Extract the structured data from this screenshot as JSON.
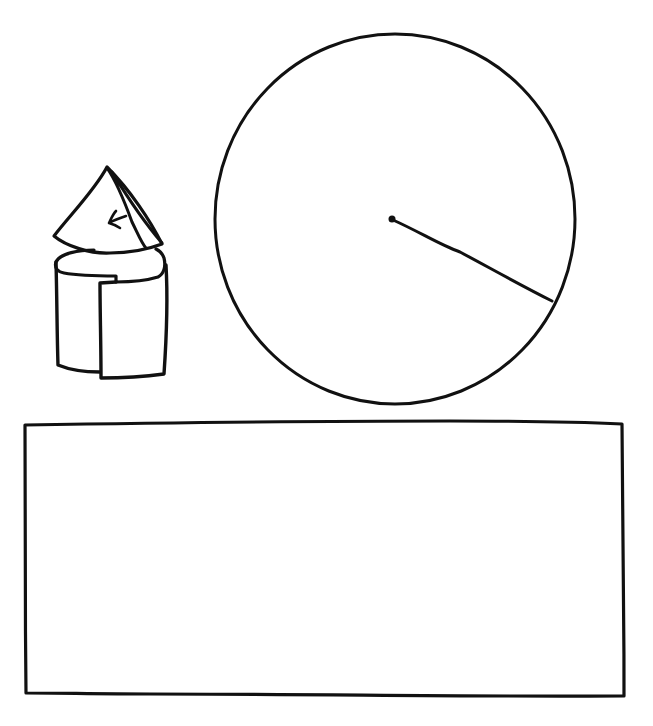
{
  "sketch": {
    "background": "#ffffff",
    "ink_color": "#111111",
    "objects": [
      {
        "id": "cone-on-cylinder",
        "label": "Cone on top of a cylinder with a cut-out slice",
        "parts": [
          "cone",
          "cone-fold-flap",
          "arrow",
          "cylinder",
          "cylinder-cutout"
        ]
      },
      {
        "id": "circle",
        "label": "Circle with a radius line",
        "center": [
          394,
          219
        ],
        "radius_end": [
          552,
          301
        ],
        "bounds": {
          "left": 215,
          "top": 34,
          "right": 576,
          "bottom": 404
        }
      },
      {
        "id": "rectangle",
        "label": "Large empty rectangle",
        "bounds": {
          "left": 24,
          "top": 423,
          "right": 625,
          "bottom": 697
        }
      }
    ]
  }
}
